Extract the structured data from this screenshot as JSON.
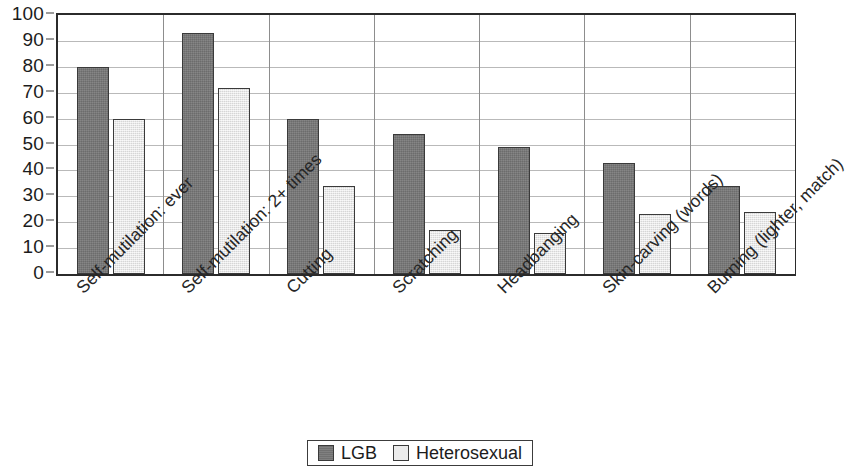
{
  "chart_data": {
    "type": "bar",
    "title": "",
    "subtitle": "",
    "xlabel": "",
    "ylabel": "",
    "ylim": [
      0,
      100
    ],
    "y_ticks": [
      0,
      10,
      20,
      30,
      40,
      50,
      60,
      70,
      80,
      90,
      100
    ],
    "grid": true,
    "legend_position": "bottom-center",
    "categories": [
      "Self-mutilation: ever",
      "Self-mutilation: 2+ times",
      "Cutting",
      "Scratching",
      "Headbanging",
      "Skin-carving (words)",
      "Burning (lighter, match)"
    ],
    "series": [
      {
        "name": "LGB",
        "color": "#787878",
        "values": [
          80,
          93,
          60,
          54,
          49,
          43,
          34
        ]
      },
      {
        "name": "Heterosexual",
        "color": "#e9e9e9",
        "values": [
          60,
          72,
          34,
          17,
          16,
          23,
          24
        ]
      }
    ]
  },
  "axis": {
    "y_tick_labels": [
      "100",
      "90",
      "80",
      "70",
      "60",
      "50",
      "40",
      "30",
      "20",
      "10",
      "0"
    ]
  },
  "legend": {
    "items": [
      {
        "label": "LGB",
        "swatch": "lgb"
      },
      {
        "label": "Heterosexual",
        "swatch": "het"
      }
    ]
  },
  "colors": {
    "lgb_bar": "#787878",
    "het_bar": "#e9e9e9",
    "bar_border": "#3a3a3a",
    "gridline": "#b9b9b9",
    "axis_line": "#2b2b2b",
    "text": "#1c1c1c",
    "background": "#ffffff"
  }
}
